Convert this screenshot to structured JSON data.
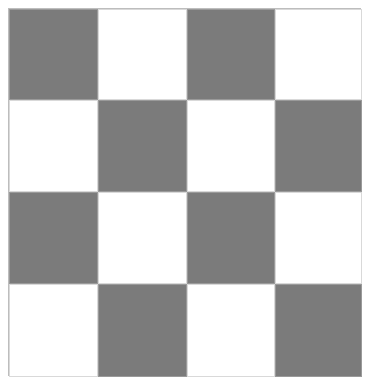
{
  "board": {
    "rows": 4,
    "cols": 4,
    "colors": {
      "dark": "#7b7b7b",
      "light": "#ffffff",
      "border": "#bdbdbd"
    },
    "cells": [
      [
        "dark",
        "light",
        "dark",
        "light"
      ],
      [
        "light",
        "dark",
        "light",
        "dark"
      ],
      [
        "dark",
        "light",
        "dark",
        "light"
      ],
      [
        "light",
        "dark",
        "light",
        "dark"
      ]
    ]
  }
}
